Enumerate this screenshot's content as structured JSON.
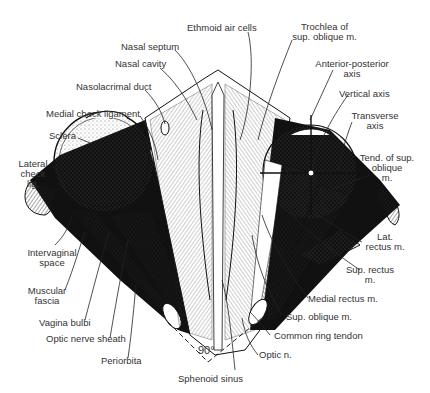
{
  "figure": {
    "type": "anatomical-diagram",
    "angle_label": "90°"
  },
  "labels": {
    "ethmoid_air_cells": "Ethmoid air cells",
    "trochlea_1": "Trochlea of",
    "trochlea_2": "sup. oblique m.",
    "nasal_septum": "Nasal septum",
    "nasal_cavity": "Nasal cavity",
    "nasolacrimal_duct": "Nasolacrimal duct",
    "medial_check_ligament": "Medial check ligament",
    "sclera": "Sclera",
    "lateral_check_1": "Lateral",
    "lateral_check_2": "check",
    "lateral_check_3": "lig.",
    "ap_axis_1": "Anterior-posterior",
    "ap_axis_2": "axis",
    "vertical_axis": "Vertical axis",
    "transverse_axis_1": "Transverse",
    "transverse_axis_2": "axis",
    "tend_sup_oblique_1": "Tend. of sup.",
    "tend_sup_oblique_2": "oblique",
    "tend_sup_oblique_3": "m.",
    "intervaginal_1": "Intervaginal",
    "intervaginal_2": "space",
    "muscular_fascia_1": "Muscular",
    "muscular_fascia_2": "fascia",
    "vagina_bulbi": "Vagina bulbi",
    "optic_nerve_sheath": "Optic nerve sheath",
    "periorbita": "Periorbita",
    "sphenoid_sinus": "Sphenoid sinus",
    "lat_rectus_1": "Lat.",
    "lat_rectus_2": "rectus m.",
    "sup_rectus_1": "Sup. rectus",
    "sup_rectus_2": "m.",
    "medial_rectus": "Medial rectus m.",
    "sup_oblique": "Sup. oblique m.",
    "common_ring_tendon": "Common ring tendon",
    "optic_n": "Optic n."
  },
  "colors": {
    "ink": "#1a1a1a",
    "text": "#333333",
    "background": "#ffffff"
  }
}
